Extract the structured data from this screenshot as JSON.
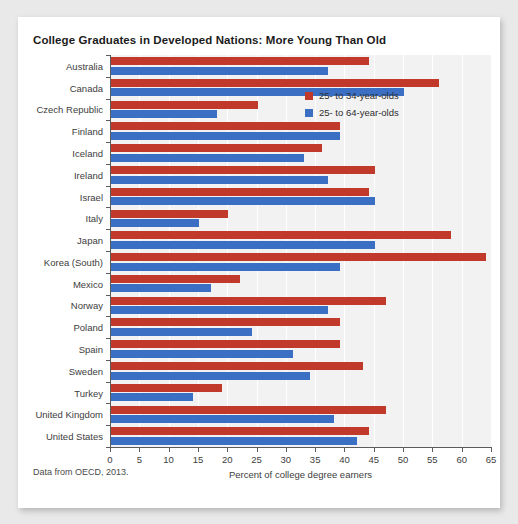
{
  "chart_data": {
    "type": "bar",
    "orientation": "horizontal",
    "title": "College Graduates in Developed Nations: More Young Than Old",
    "xlabel": "Percent of college degree earners",
    "ylabel": "",
    "xlim": [
      0,
      65
    ],
    "xticks": [
      0,
      5,
      10,
      15,
      20,
      25,
      30,
      35,
      40,
      45,
      50,
      55,
      60,
      65
    ],
    "grid": true,
    "legend_position": "upper right",
    "source_note": "Data from OECD, 2013.",
    "categories": [
      "Australia",
      "Canada",
      "Czech Republic",
      "Finland",
      "Iceland",
      "Ireland",
      "Israel",
      "Italy",
      "Japan",
      "Korea (South)",
      "Mexico",
      "Norway",
      "Poland",
      "Spain",
      "Sweden",
      "Turkey",
      "United Kingdom",
      "United States"
    ],
    "series": [
      {
        "name": "25- to 34-year-olds",
        "color": "#c0392b",
        "values": [
          44,
          56,
          25,
          39,
          36,
          45,
          44,
          20,
          58,
          64,
          22,
          47,
          39,
          39,
          43,
          19,
          47,
          44
        ]
      },
      {
        "name": "25- to 64-year-olds",
        "color": "#3a6fc4",
        "values": [
          37,
          50,
          18,
          39,
          33,
          37,
          45,
          15,
          45,
          39,
          17,
          37,
          24,
          31,
          34,
          14,
          38,
          42
        ]
      }
    ]
  },
  "legend": {
    "items": [
      {
        "label": "25- to 34-year-olds",
        "color": "#c0392b",
        "swatch_name": "legend-swatch-red"
      },
      {
        "label": "25- to 64-year-olds",
        "color": "#3a6fc4",
        "swatch_name": "legend-swatch-blue"
      }
    ]
  }
}
